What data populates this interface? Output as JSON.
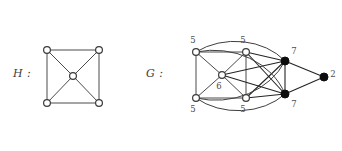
{
  "figure": {
    "width": 342,
    "height": 151,
    "background": "#ffffff",
    "stroke_color": "#4a4a4a",
    "node_open_fill": "#ffffff",
    "node_filled_fill": "#0d0d0d",
    "label_color": "#3b3b3b"
  },
  "graphs": [
    {
      "name": "H",
      "caption": "H :",
      "type": "graph-diagram",
      "description": "wheel on 5 vertices: square with center vertex joined to all corners",
      "vertices": [
        {
          "id": "h-top-left",
          "x": 47,
          "y": 50,
          "style": "open",
          "label": ""
        },
        {
          "id": "h-top-right",
          "x": 99,
          "y": 50,
          "style": "open",
          "label": ""
        },
        {
          "id": "h-bottom-left",
          "x": 47,
          "y": 103,
          "style": "open",
          "label": ""
        },
        {
          "id": "h-bottom-right",
          "x": 99,
          "y": 103,
          "style": "open",
          "label": ""
        },
        {
          "id": "h-center",
          "x": 73,
          "y": 76,
          "style": "open",
          "label": ""
        }
      ],
      "edges": [
        {
          "from": "h-top-left",
          "to": "h-top-right"
        },
        {
          "from": "h-top-left",
          "to": "h-bottom-left"
        },
        {
          "from": "h-top-right",
          "to": "h-bottom-right"
        },
        {
          "from": "h-bottom-left",
          "to": "h-bottom-right"
        },
        {
          "from": "h-top-left",
          "to": "h-center"
        },
        {
          "from": "h-top-right",
          "to": "h-center"
        },
        {
          "from": "h-bottom-left",
          "to": "h-center"
        },
        {
          "from": "h-bottom-right",
          "to": "h-center"
        }
      ]
    },
    {
      "name": "G",
      "caption": "G :",
      "type": "graph-diagram",
      "description": "labelled graph with four degree-5 vertices, one degree-6 centre, two degree-7 black vertices and one degree-2 black vertex",
      "vertices": [
        {
          "id": "g-top-left",
          "x": 196,
          "y": 52,
          "style": "open",
          "label": "5",
          "label_x": 193,
          "label_y": 43
        },
        {
          "id": "g-top-mid",
          "x": 246,
          "y": 52,
          "style": "open",
          "label": "5",
          "label_x": 243,
          "label_y": 43
        },
        {
          "id": "g-bottom-left",
          "x": 196,
          "y": 98,
          "style": "open",
          "label": "5",
          "label_x": 193,
          "label_y": 112
        },
        {
          "id": "g-bottom-mid",
          "x": 246,
          "y": 98,
          "style": "open",
          "label": "5",
          "label_x": 243,
          "label_y": 112
        },
        {
          "id": "g-center",
          "x": 222,
          "y": 75,
          "style": "open",
          "label": "6",
          "label_x": 219,
          "label_y": 89
        },
        {
          "id": "g-right-top",
          "x": 285,
          "y": 61,
          "style": "filled",
          "label": "7",
          "label_x": 294,
          "label_y": 54
        },
        {
          "id": "g-right-bottom",
          "x": 285,
          "y": 94,
          "style": "filled",
          "label": "7",
          "label_x": 294,
          "label_y": 107
        },
        {
          "id": "g-far-right",
          "x": 324,
          "y": 77,
          "style": "filled",
          "label": "2",
          "label_x": 333,
          "label_y": 77
        }
      ],
      "edges": [
        {
          "from": "g-top-left",
          "to": "g-top-mid",
          "kind": "straight"
        },
        {
          "from": "g-top-left",
          "to": "g-bottom-left",
          "kind": "straight"
        },
        {
          "from": "g-bottom-left",
          "to": "g-bottom-mid",
          "kind": "straight"
        },
        {
          "from": "g-top-mid",
          "to": "g-bottom-mid",
          "kind": "straight"
        },
        {
          "from": "g-top-left",
          "to": "g-center",
          "kind": "straight"
        },
        {
          "from": "g-top-mid",
          "to": "g-center",
          "kind": "straight"
        },
        {
          "from": "g-bottom-left",
          "to": "g-center",
          "kind": "straight"
        },
        {
          "from": "g-bottom-mid",
          "to": "g-center",
          "kind": "straight"
        },
        {
          "from": "g-center",
          "to": "g-right-top",
          "kind": "straight"
        },
        {
          "from": "g-center",
          "to": "g-right-bottom",
          "kind": "straight"
        },
        {
          "from": "g-top-mid",
          "to": "g-right-top",
          "kind": "straight"
        },
        {
          "from": "g-top-mid",
          "to": "g-right-bottom",
          "kind": "straight"
        },
        {
          "from": "g-bottom-mid",
          "to": "g-right-top",
          "kind": "straight"
        },
        {
          "from": "g-bottom-mid",
          "to": "g-right-bottom",
          "kind": "straight"
        },
        {
          "from": "g-right-top",
          "to": "g-right-bottom",
          "kind": "straight"
        },
        {
          "from": "g-right-top",
          "to": "g-far-right",
          "kind": "straight"
        },
        {
          "from": "g-right-bottom",
          "to": "g-far-right",
          "kind": "straight"
        },
        {
          "from": "g-top-left",
          "to": "g-right-top",
          "kind": "arc-over-top"
        },
        {
          "from": "g-top-left",
          "to": "g-right-bottom",
          "kind": "arc-over-top-wide"
        },
        {
          "from": "g-bottom-left",
          "to": "g-right-bottom",
          "kind": "arc-under-bottom"
        },
        {
          "from": "g-bottom-left",
          "to": "g-right-top",
          "kind": "arc-under-bottom-wide"
        }
      ]
    }
  ]
}
